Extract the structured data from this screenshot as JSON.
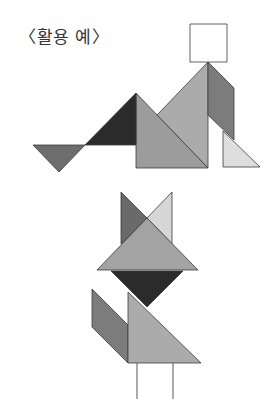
{
  "caption": "〈활용 예〉",
  "figures": [
    {
      "name": "sitting-person",
      "pieces": [
        {
          "id": "head-square",
          "shape": "square",
          "points": "190,24 227,24 227,62 190,62",
          "color": "#ffffff"
        },
        {
          "id": "back-large-triangle",
          "shape": "triangle",
          "points": "208,62 208,168 157,115",
          "color": "#ababab"
        },
        {
          "id": "front-large-triangle",
          "shape": "triangle",
          "points": "136,93 136,168 208,168",
          "color": "#9c9c9c"
        },
        {
          "id": "dark-medium-triangle",
          "shape": "triangle",
          "points": "85,145 136,93 136,145",
          "color": "#2b2b2b"
        },
        {
          "id": "foot-small-triangle",
          "shape": "triangle",
          "points": "33,145 85,145 59,172",
          "color": "#6e6e6e"
        },
        {
          "id": "arm-parallelogram",
          "shape": "parallelogram",
          "points": "208,62 234,88 234,140 208,115",
          "color": "#7c7c7c"
        },
        {
          "id": "leg-light-triangle",
          "shape": "triangle",
          "points": "223,131 223,167 260,167",
          "color": "#dedede"
        }
      ]
    },
    {
      "name": "standing-fox",
      "pieces": [
        {
          "id": "left-ear-triangle",
          "shape": "triangle",
          "points": "121,192 147,218 121,244",
          "color": "#6a6a6a"
        },
        {
          "id": "right-ear-triangle",
          "shape": "triangle",
          "points": "172,192 172,244 147,218",
          "color": "#d6d6d6"
        },
        {
          "id": "head-large-triangle",
          "shape": "triangle",
          "points": "147,218 97,270 198,270",
          "color": "#a3a3a3"
        },
        {
          "id": "neck-dark-triangle",
          "shape": "triangle",
          "points": "111,271 183,271 147,307",
          "color": "#2b2b2b"
        },
        {
          "id": "tail-parallelogram",
          "shape": "parallelogram",
          "points": "92,289 128,325 128,363 92,327",
          "color": "#7c7c7c"
        },
        {
          "id": "body-large-triangle",
          "shape": "triangle",
          "points": "128,292 128,363 201,363",
          "color": "#ababab"
        }
      ],
      "legs": [
        {
          "id": "left-leg-line",
          "x1": 137,
          "y1": 363,
          "x2": 137,
          "y2": 399
        },
        {
          "id": "right-leg-line",
          "x1": 173,
          "y1": 363,
          "x2": 173,
          "y2": 399
        }
      ]
    }
  ]
}
